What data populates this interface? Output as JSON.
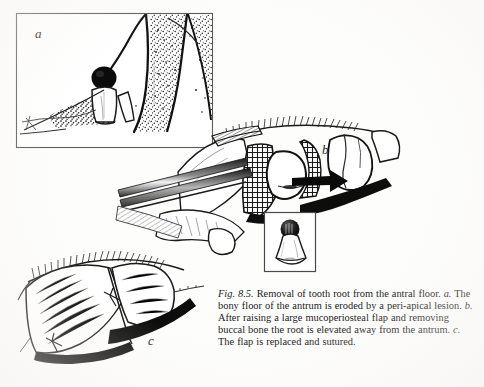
{
  "figure": {
    "panels": [
      {
        "key": "a",
        "label": "a"
      },
      {
        "key": "b",
        "label": "b"
      },
      {
        "key": "c",
        "label": "c"
      }
    ],
    "inset": {
      "name": "extracted-tooth-root",
      "description": "tooth root with dark crown"
    },
    "colors": {
      "ink": "#1a1a1a",
      "paper": "#fdfdfc",
      "box_border": "#4a4a4a"
    }
  },
  "caption": {
    "figure_number": "Fig. 8.5.",
    "title": "Removal of tooth root from the antral floor.",
    "parts": [
      {
        "label": "a.",
        "text": "The bony floor of the antrum is eroded by a peri-apical lesion."
      },
      {
        "label": "b.",
        "text": "After raising a large mucoperiosteal flap and removing buccal bone the root is elevated away from the antrum."
      },
      {
        "label": "c.",
        "text": "The flap is replaced and sutured."
      }
    ],
    "full_text": "Fig. 8.5. Removal of tooth root from the antral floor. a. The bony floor of the antrum is eroded by a peri-apical lesion. b. After raising a large mucoperiosteal flap and removing buccal bone the root is elevated away from the antrum. c. The flap is replaced and sutured."
  }
}
